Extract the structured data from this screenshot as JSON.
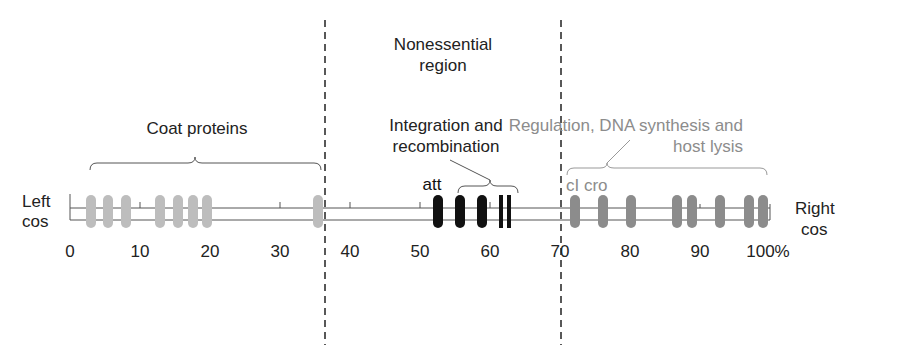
{
  "regions": {
    "nonessential": {
      "line1": "Nonessential",
      "line2": "region"
    },
    "coat": {
      "label": "Coat proteins"
    },
    "integration": {
      "line1": "Integration and",
      "line2": "recombination"
    },
    "regulation": {
      "line1": "Regulation, DNA synthesis and",
      "line2": "host lysis"
    }
  },
  "ends": {
    "left": {
      "line1": "Left",
      "line2": "cos"
    },
    "right": {
      "line1": "Right",
      "line2": "cos"
    }
  },
  "markers": {
    "att": "att",
    "cI_cro": "cI cro"
  },
  "axis": {
    "ticks": [
      "0",
      "10",
      "20",
      "30",
      "40",
      "50",
      "60",
      "70",
      "80",
      "90",
      "100%"
    ]
  },
  "colors": {
    "coat": "#bdbdbd",
    "integration": "#111111",
    "regulation": "#8c8c8c",
    "line": "#555555"
  },
  "genes": {
    "coat_positions": [
      3.5,
      6,
      8,
      13,
      16,
      18,
      20,
      35.5
    ],
    "integration_positions": [
      52.5,
      55.5,
      58.5
    ],
    "integration_bars": [
      61.5,
      62.8
    ],
    "regulation_positions": [
      72,
      76,
      80,
      86.5,
      89,
      93,
      97,
      99
    ]
  }
}
